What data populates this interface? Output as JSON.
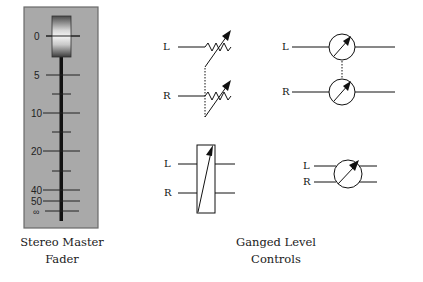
{
  "fader": {
    "caption_line1": "Stereo Master",
    "caption_line2": "Fader",
    "scale_labels": [
      "0",
      "5",
      "10",
      "20",
      "40",
      "50",
      "∞"
    ],
    "panel_color": "#a9a9a9"
  },
  "ganged": {
    "caption_line1": "Ganged Level",
    "caption_line2": "Controls",
    "diagrams": [
      {
        "name": "dual-variable-resistor",
        "labels": [
          "L",
          "R"
        ]
      },
      {
        "name": "dual-rotary-pot",
        "labels": [
          "L",
          "R"
        ]
      },
      {
        "name": "ganged-slider-box",
        "labels": [
          "L",
          "R"
        ]
      },
      {
        "name": "single-rotary-gang",
        "labels": [
          "L",
          "R"
        ]
      }
    ]
  }
}
